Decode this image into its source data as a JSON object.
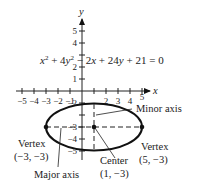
{
  "diagram": {
    "equation": {
      "text": "x² + 4y² − 2x + 24y + 21 = 0",
      "parts": [
        "x",
        "2",
        " + 4",
        "y",
        "2",
        " − 2",
        "x",
        " + 24",
        "y",
        " + 21 = 0"
      ]
    },
    "axes": {
      "x_label": "x",
      "y_label": "y",
      "x_ticks": [
        "−5",
        "−4",
        "−3",
        "−2",
        "−1",
        "2",
        "3",
        "4",
        "5"
      ],
      "y_ticks_pos": [
        "5",
        "4",
        "2",
        "1"
      ],
      "y_ticks_neg": [
        "−2",
        "−3",
        "−4",
        "−5"
      ]
    },
    "ellipse": {
      "center": [
        1,
        -3
      ],
      "a": 4,
      "b": 2
    },
    "annotations": {
      "minor_axis": "Minor axis",
      "major_axis": "Major axis",
      "vertex_left_title": "Vertex",
      "vertex_left_coords": "(−3, −3)",
      "vertex_right_title": "Vertex",
      "vertex_right_coords": "(5, −3)",
      "center_title": "Center",
      "center_coords": "(1, −3)"
    }
  }
}
